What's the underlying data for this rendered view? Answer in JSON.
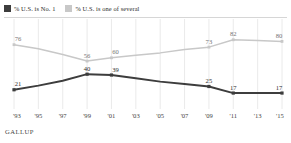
{
  "legend": {
    "entries": [
      {
        "label": "% U.S. is No. 1",
        "color": "#3d3d3d",
        "key": "no1"
      },
      {
        "label": "% U.S. is one of several",
        "color": "#c8c8c8",
        "key": "several"
      }
    ]
  },
  "source": "GALLUP",
  "chart_data": {
    "type": "line",
    "title": "",
    "subtitle": "",
    "xlabel": "",
    "ylabel": "",
    "ylim": [
      0,
      100
    ],
    "grid": true,
    "legend_position": "top-left",
    "categories": [
      "'93",
      "'95",
      "'97",
      "'99",
      "'01",
      "'03",
      "'05",
      "'07",
      "'09",
      "'11",
      "'13",
      "'15"
    ],
    "tick_labels": [
      "'93",
      "'95",
      "'97",
      "'99",
      "'01",
      "'03",
      "'05",
      "'07",
      "'09",
      "'11",
      "'13",
      "'15"
    ],
    "series": [
      {
        "name": "% U.S. is No. 1",
        "key": "no1",
        "color": "#3d3d3d",
        "values": [
          21,
          26,
          32,
          40,
          39,
          35,
          31,
          28,
          25,
          17,
          17,
          17
        ],
        "labeled_points": [
          {
            "index": 0,
            "value": 21
          },
          {
            "index": 3,
            "value": 40
          },
          {
            "index": 4,
            "value": 39
          },
          {
            "index": 8,
            "value": 25
          },
          {
            "index": 9,
            "value": 17
          },
          {
            "index": 11,
            "value": 17
          }
        ]
      },
      {
        "name": "% U.S. is one of several",
        "key": "several",
        "color": "#c8c8c8",
        "values": [
          76,
          71,
          64,
          56,
          60,
          63,
          66,
          70,
          73,
          82,
          81,
          80
        ],
        "labeled_points": [
          {
            "index": 0,
            "value": 76
          },
          {
            "index": 3,
            "value": 56
          },
          {
            "index": 4,
            "value": 60
          },
          {
            "index": 8,
            "value": 73
          },
          {
            "index": 9,
            "value": 82
          },
          {
            "index": 11,
            "value": 80
          }
        ]
      }
    ]
  }
}
